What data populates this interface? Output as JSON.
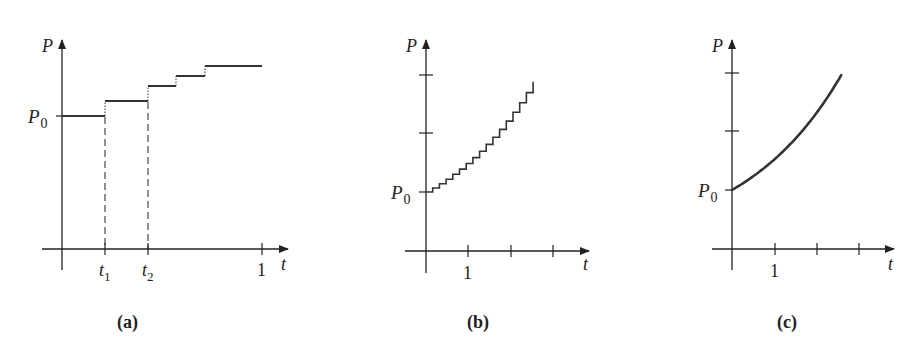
{
  "chart_data": [
    {
      "panel": "a",
      "type": "line",
      "title": "(a)",
      "xlabel": "t",
      "ylabel": "P",
      "x_tick_labels": [
        "t1",
        "t2",
        "1"
      ],
      "y_tick_labels": [
        "P0"
      ],
      "description": "Piecewise-constant (staircase) growth with few compounding periods",
      "steps": [
        {
          "t_start": 0.0,
          "t_end": 0.215,
          "P": 1.0
        },
        {
          "t_start": 0.215,
          "t_end": 0.43,
          "P": 1.11
        },
        {
          "t_start": 0.43,
          "t_end": 0.57,
          "P": 1.22
        },
        {
          "t_start": 0.57,
          "t_end": 0.715,
          "P": 1.3
        },
        {
          "t_start": 0.715,
          "t_end": 1.0,
          "P": 1.37
        }
      ],
      "dashed_guides_at": [
        "t1",
        "t2"
      ],
      "xlim": [
        0,
        1.1
      ],
      "grid": false
    },
    {
      "panel": "b",
      "type": "line",
      "title": "(b)",
      "xlabel": "t",
      "ylabel": "P",
      "x_tick_labels": [
        "1"
      ],
      "x_ticks": [
        1,
        2,
        3
      ],
      "y_tick_labels": [
        "P0"
      ],
      "y_ticks": [
        1,
        2,
        3
      ],
      "description": "Staircase approximation with many small compounding steps",
      "num_steps": 16,
      "t_end": 2.55,
      "P_end": 2.9,
      "growth_rate": 0.42,
      "grid": false
    },
    {
      "panel": "c",
      "type": "line",
      "title": "(c)",
      "xlabel": "t",
      "ylabel": "P",
      "x_tick_labels": [
        "1"
      ],
      "x_ticks": [
        1,
        2,
        3
      ],
      "y_tick_labels": [
        "P0"
      ],
      "y_ticks": [
        1,
        2,
        3
      ],
      "description": "Continuous exponential growth P = P0 e^{rt}",
      "t_end": 2.6,
      "P_end": 2.98,
      "growth_rate": 0.42,
      "grid": false
    }
  ],
  "labels": {
    "a": {
      "caption": "(a)",
      "y_axis": "P",
      "x_axis": "t",
      "p0": "P",
      "p0_sub": "0",
      "t1": "t",
      "t1_sub": "1",
      "t2": "t",
      "t2_sub": "2",
      "one": "1"
    },
    "b": {
      "caption": "(b)",
      "y_axis": "P",
      "x_axis": "t",
      "p0": "P",
      "p0_sub": "0",
      "one": "1"
    },
    "c": {
      "caption": "(c)",
      "y_axis": "P",
      "x_axis": "t",
      "p0": "P",
      "p0_sub": "0",
      "one": "1"
    }
  },
  "colors": {
    "ink": "#222222",
    "background": "#ffffff"
  }
}
